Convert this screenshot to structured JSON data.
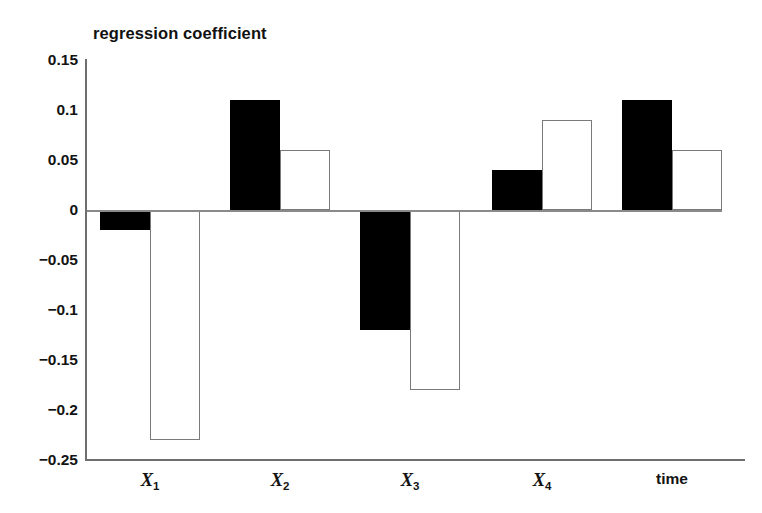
{
  "chart_data": {
    "type": "bar",
    "title": "regression coefficient",
    "xlabel": "",
    "ylabel": "regression coefficient",
    "categories": [
      "X1",
      "X2",
      "X3",
      "X4",
      "time"
    ],
    "category_labels": [
      {
        "base": "X",
        "sub": "1",
        "italic": true
      },
      {
        "base": "X",
        "sub": "2",
        "italic": true
      },
      {
        "base": "X",
        "sub": "3",
        "italic": true
      },
      {
        "base": "X",
        "sub": "4",
        "italic": true
      },
      {
        "base": "time",
        "sub": "",
        "italic": false
      }
    ],
    "series": [
      {
        "name": "filled",
        "style": "black-filled",
        "values": [
          -0.02,
          0.11,
          -0.12,
          0.04,
          0.11
        ]
      },
      {
        "name": "hollow",
        "style": "white-outline",
        "values": [
          -0.23,
          0.06,
          -0.18,
          0.09,
          0.06
        ]
      }
    ],
    "ylim": [
      -0.25,
      0.15
    ],
    "ytick_labels": [
      "0.15",
      "0.1",
      "0.05",
      "0",
      "−0.05",
      "−0.1",
      "−0.15",
      "−0.2",
      "−0.25"
    ],
    "ytick_values": [
      0.15,
      0.1,
      0.05,
      0,
      -0.05,
      -0.1,
      -0.15,
      -0.2,
      -0.25
    ],
    "grid": false,
    "legend": "none",
    "zero_line": 0,
    "colors": {
      "filled_bar": "#000000",
      "hollow_bar_fill": "#ffffff",
      "hollow_bar_border": "#7a7a7a",
      "axis": "#6e6e6e",
      "text": "#131313",
      "background": "#ffffff"
    }
  }
}
